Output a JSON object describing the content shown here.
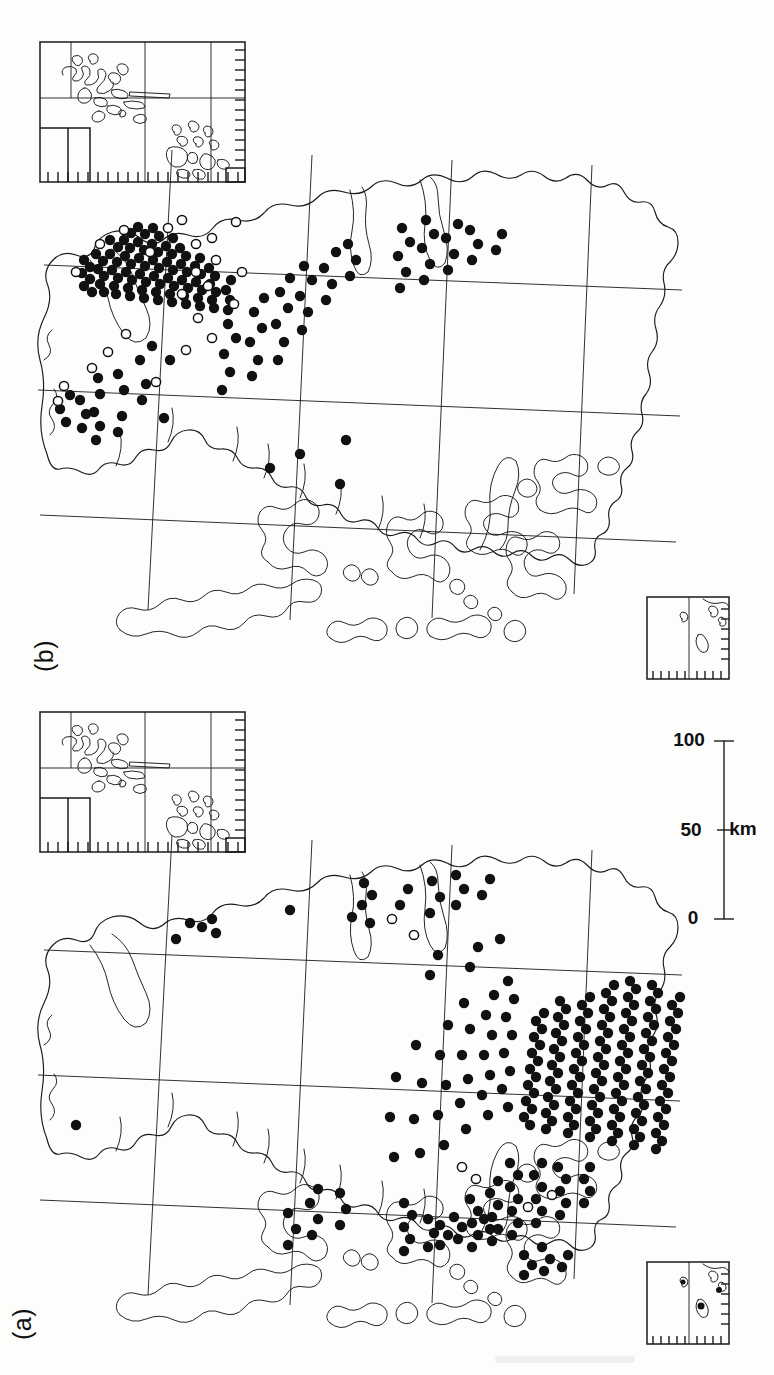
{
  "figure": {
    "type": "distribution-map-pair",
    "orientation": "page rotated 90 degrees counter-clockwise",
    "region": "Scotland",
    "panels": [
      {
        "id": "a",
        "label": "(a)",
        "has_inset_northern_isles": true,
        "has_inset_outer_box": true,
        "has_scalebar": true,
        "symbols": [
          "filled-circle",
          "open-circle"
        ],
        "record_density": "very dense in south-west and central belt"
      },
      {
        "id": "b",
        "label": "(b)",
        "has_inset_northern_isles": true,
        "has_inset_outer_box": true,
        "has_scalebar": false,
        "symbols": [
          "filled-circle",
          "open-circle"
        ],
        "record_density": "concentrated in north-east and east"
      }
    ]
  },
  "scalebar": {
    "name": "km-scale-bar",
    "unit_label": "km",
    "ticks": [
      "0",
      "50",
      "100"
    ],
    "minor_tick_count": 4
  },
  "insets": {
    "northern_isles": {
      "name": "northern-isles-inset",
      "contents": [
        "Orkney",
        "Shetland"
      ],
      "has_graticule": true,
      "has_ruler_ticks": true
    },
    "small_inset": {
      "name": "small-islands-inset",
      "has_graticule": true,
      "has_ruler_ticks": true
    }
  },
  "colors": {
    "ink": "#1a1a1a",
    "paper": "#fdfdfc",
    "dot_fill": "#111111",
    "dot_open_fill": "#ffffff"
  },
  "chart_data": {
    "type": "scatter",
    "title": "",
    "xlabel": "",
    "ylabel": "",
    "legend": [
      "filled circle = record",
      "open circle = older record"
    ],
    "series": [
      {
        "name": "panel-a-filled",
        "count_estimate": 420,
        "description": "dense cluster across south-west lowlands and central belt, scattered records along west coast and inner islands"
      },
      {
        "name": "panel-a-open",
        "count_estimate": 6,
        "description": "few open circles along the south-west coast"
      },
      {
        "name": "panel-b-filled",
        "count_estimate": 200,
        "description": "dense cluster in north-east (Moray/Aberdeenshire) extending south along east coast"
      },
      {
        "name": "panel-b-open",
        "count_estimate": 24,
        "description": "open circles scattered through the northern and eastern clusters"
      }
    ]
  }
}
